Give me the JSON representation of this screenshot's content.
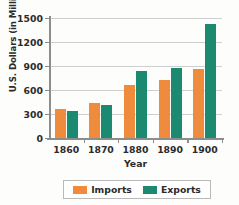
{
  "chart_data": {
    "type": "bar",
    "title": "",
    "xlabel": "Year",
    "ylabel": "U.S. Dollars (in Millions)",
    "categories": [
      "1860",
      "1870",
      "1880",
      "1890",
      "1900"
    ],
    "series": [
      {
        "name": "Imports",
        "color": "#ef8b3c",
        "values": [
          360,
          440,
          665,
          730,
          865
        ]
      },
      {
        "name": "Exports",
        "color": "#1c8a71",
        "values": [
          340,
          410,
          835,
          875,
          1430
        ]
      }
    ],
    "ylim": [
      0,
      1500
    ],
    "yticks": [
      0,
      300,
      600,
      900,
      1200,
      1500
    ],
    "ytick_labels": [
      "0",
      "300",
      "600",
      "900",
      "1200",
      "1500"
    ],
    "grid": true,
    "legend_position": "bottom"
  },
  "legend": {
    "entries": [
      {
        "label": "Imports",
        "swatch": "orange-swatch"
      },
      {
        "label": "Exports",
        "swatch": "teal-swatch"
      }
    ]
  }
}
